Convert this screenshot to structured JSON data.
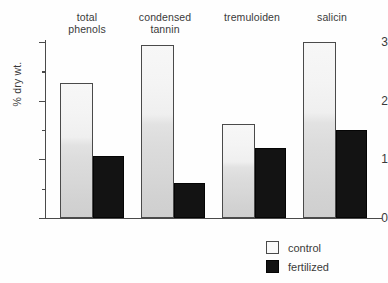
{
  "chart_data": {
    "type": "bar",
    "title": "",
    "xlabel": "",
    "ylabel": "% dry wt.",
    "ylim": [
      0,
      3.1
    ],
    "yticks": [
      "0",
      "1",
      "2",
      "3"
    ],
    "ytick_values": [
      0,
      1,
      2,
      3
    ],
    "minor_ticks": [
      0.5,
      1.5,
      2.5
    ],
    "grid": false,
    "legend_position": "bottom-right",
    "categories": [
      "total phenols",
      "condensed tannin",
      "tremuloiden",
      "salicin"
    ],
    "category_lines": [
      [
        "total",
        "phenols"
      ],
      [
        "condensed",
        "tannin"
      ],
      [
        "tremuloiden",
        ""
      ],
      [
        "salicin",
        ""
      ]
    ],
    "series": [
      {
        "name": "control",
        "color": "#efefef",
        "values": [
          2.3,
          2.95,
          1.6,
          3.0
        ]
      },
      {
        "name": "fertilized",
        "color": "#131313",
        "values": [
          1.05,
          0.6,
          1.2,
          1.5
        ]
      }
    ]
  },
  "legend": {
    "items": [
      {
        "label": "control",
        "swatch": "control"
      },
      {
        "label": "fertilized",
        "swatch": "fertilized"
      }
    ]
  }
}
